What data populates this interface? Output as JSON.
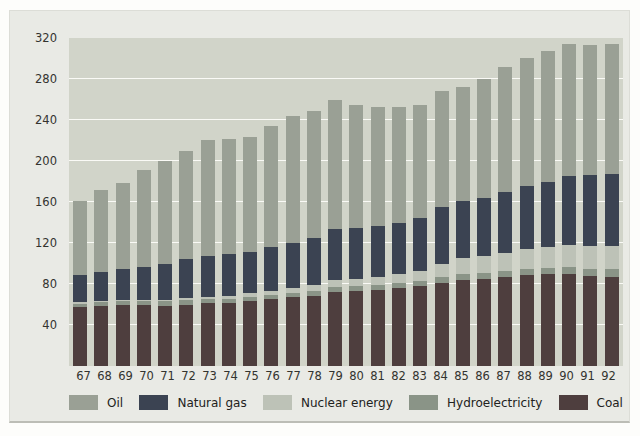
{
  "figure": {
    "kind": "stacked bar chart",
    "y_axis_title_prefix": "Energy consumption 10",
    "y_axis_title_sup": "18",
    "y_axis_title_suffix": " joules (exajoules)"
  },
  "colors": {
    "card_bg": "#e9eae5",
    "plot_bg": "#d1d4c9",
    "gridline": "#fafaf6",
    "oil": "#9aa095",
    "natural_gas": "#3b4352",
    "nuclear": "#bdc2b7",
    "hydro": "#8a9487",
    "coal": "#4e3e3e"
  },
  "chart_data": {
    "type": "bar",
    "stacked": true,
    "title": "",
    "xlabel": "",
    "ylabel": "Energy consumption 10^18 joules (exajoules)",
    "ylim": [
      0,
      320
    ],
    "yticks": [
      40,
      80,
      120,
      160,
      200,
      240,
      280,
      320
    ],
    "grid": "horizontal white gridlines",
    "legend_position": "bottom",
    "categories": [
      "67",
      "68",
      "69",
      "70",
      "71",
      "72",
      "73",
      "74",
      "75",
      "76",
      "77",
      "78",
      "79",
      "80",
      "81",
      "82",
      "83",
      "84",
      "85",
      "86",
      "87",
      "88",
      "89",
      "90",
      "91",
      "92"
    ],
    "stack_order_bottom_to_top": [
      "Coal",
      "Hydroelectricity",
      "Nuclear energy",
      "Natural gas",
      "Oil"
    ],
    "series": [
      {
        "name": "Oil",
        "color": "#9aa095",
        "values": [
          72,
          80,
          84,
          94,
          100,
          106,
          114,
          113,
          112,
          118,
          124,
          124,
          126,
          120,
          116,
          113,
          111,
          113,
          111,
          116,
          122,
          125,
          127,
          129,
          127,
          127
        ]
      },
      {
        "name": "Natural gas",
        "color": "#3b4352",
        "values": [
          27,
          29,
          31,
          33,
          36,
          38,
          40,
          41,
          40,
          43,
          44,
          46,
          50,
          50,
          50,
          50,
          51,
          55,
          56,
          57,
          60,
          62,
          64,
          67,
          69,
          70
        ]
      },
      {
        "name": "Nuclear energy",
        "color": "#bdc2b7",
        "values": [
          1,
          1,
          1,
          1,
          1,
          2,
          2,
          3,
          4,
          4,
          5,
          6,
          7,
          7,
          8,
          9,
          10,
          13,
          15,
          16,
          17,
          19,
          20,
          21,
          22,
          22
        ]
      },
      {
        "name": "Hydroelectricity",
        "color": "#8a9487",
        "values": [
          3,
          3,
          3,
          3,
          4,
          4,
          4,
          4,
          4,
          4,
          4,
          5,
          5,
          5,
          5,
          5,
          5,
          6,
          6,
          6,
          6,
          6,
          6,
          7,
          7,
          8
        ]
      },
      {
        "name": "Coal",
        "color": "#4e3e3e",
        "values": [
          58,
          59,
          60,
          60,
          59,
          60,
          61,
          61,
          63,
          65,
          67,
          68,
          72,
          73,
          74,
          76,
          78,
          81,
          84,
          85,
          87,
          89,
          90,
          90,
          88,
          87
        ]
      }
    ],
    "totals": [
      161,
      172,
      179,
      191,
      200,
      210,
      221,
      222,
      223,
      234,
      244,
      249,
      260,
      255,
      253,
      253,
      255,
      268,
      272,
      280,
      292,
      301,
      307,
      314,
      313,
      314
    ]
  }
}
